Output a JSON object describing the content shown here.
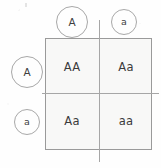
{
  "diagram": {
    "type": "punnett-square",
    "title": "",
    "parent_alleles_top": [
      {
        "label": "A",
        "size": "large"
      },
      {
        "label": "a",
        "size": "small"
      }
    ],
    "parent_alleles_left": [
      {
        "label": "A",
        "size": "large"
      },
      {
        "label": "a",
        "size": "small"
      }
    ],
    "cells": [
      {
        "position": "top-left",
        "genotype": "AA"
      },
      {
        "position": "top-right",
        "genotype": "Aa"
      },
      {
        "position": "bottom-left",
        "genotype": "Aa"
      },
      {
        "position": "bottom-right",
        "genotype": "aa"
      }
    ],
    "colors": {
      "background": "#fefefe",
      "box_fill": "#f8f8f7",
      "box_border": "#9a9a9a",
      "divider": "#a6a6a6",
      "text": "#3b3b3b",
      "circle_border": "#a8a8a8"
    }
  }
}
